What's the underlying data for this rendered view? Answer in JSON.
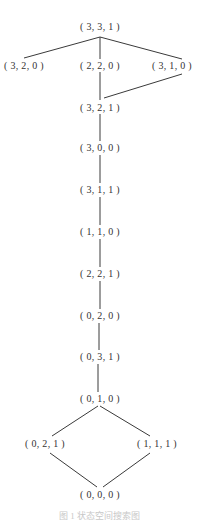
{
  "diagram": {
    "type": "state-lattice",
    "nodes": [
      {
        "id": "n331",
        "label": "( 3, 3, 1 )",
        "x": 100,
        "y": 27
      },
      {
        "id": "n320",
        "label": "( 3, 2, 0 )",
        "x": 24,
        "y": 66
      },
      {
        "id": "n220",
        "label": "( 2, 2, 0 )",
        "x": 100,
        "y": 66
      },
      {
        "id": "n310",
        "label": "( 3, 1, 0 )",
        "x": 172,
        "y": 66
      },
      {
        "id": "n321",
        "label": "( 3, 2, 1 )",
        "x": 100,
        "y": 108
      },
      {
        "id": "n300",
        "label": "( 3, 0, 0 )",
        "x": 100,
        "y": 148
      },
      {
        "id": "n311",
        "label": "( 3, 1, 1 )",
        "x": 100,
        "y": 190
      },
      {
        "id": "n110",
        "label": "( 1, 1, 0 )",
        "x": 100,
        "y": 232
      },
      {
        "id": "n221",
        "label": "( 2, 2, 1 )",
        "x": 100,
        "y": 274
      },
      {
        "id": "n020",
        "label": "( 0, 2, 0 )",
        "x": 100,
        "y": 316
      },
      {
        "id": "n031",
        "label": "( 0, 3, 1 )",
        "x": 100,
        "y": 357
      },
      {
        "id": "n010",
        "label": "( 0, 1, 0 )",
        "x": 100,
        "y": 399
      },
      {
        "id": "n021",
        "label": "( 0, 2, 1 )",
        "x": 45,
        "y": 444
      },
      {
        "id": "n111",
        "label": "( 1, 1, 1 )",
        "x": 157,
        "y": 444
      },
      {
        "id": "n000",
        "label": "( 0, 0, 0 )",
        "x": 100,
        "y": 495
      }
    ],
    "edges": [
      {
        "from": "n331",
        "to": "n320",
        "x1": 100,
        "y1": 37,
        "x2": 24,
        "y2": 58
      },
      {
        "from": "n331",
        "to": "n220",
        "x1": 100,
        "y1": 37,
        "x2": 100,
        "y2": 59
      },
      {
        "from": "n331",
        "to": "n310",
        "x1": 100,
        "y1": 37,
        "x2": 182,
        "y2": 59
      },
      {
        "from": "n220",
        "to": "n321",
        "x1": 100,
        "y1": 72,
        "x2": 100,
        "y2": 100
      },
      {
        "from": "n310",
        "to": "n321",
        "x1": 182,
        "y1": 74,
        "x2": 104,
        "y2": 98
      },
      {
        "from": "n321",
        "to": "n300",
        "x1": 100,
        "y1": 114,
        "x2": 100,
        "y2": 141
      },
      {
        "from": "n300",
        "to": "n311",
        "x1": 100,
        "y1": 155,
        "x2": 100,
        "y2": 183
      },
      {
        "from": "n311",
        "to": "n110",
        "x1": 100,
        "y1": 197,
        "x2": 100,
        "y2": 225
      },
      {
        "from": "n110",
        "to": "n221",
        "x1": 100,
        "y1": 239,
        "x2": 100,
        "y2": 267
      },
      {
        "from": "n221",
        "to": "n020",
        "x1": 100,
        "y1": 281,
        "x2": 100,
        "y2": 309
      },
      {
        "from": "n020",
        "to": "n031",
        "x1": 99,
        "y1": 323,
        "x2": 99,
        "y2": 350
      },
      {
        "from": "n031",
        "to": "n010",
        "x1": 98,
        "y1": 364,
        "x2": 98,
        "y2": 392
      },
      {
        "from": "n010",
        "to": "n021",
        "x1": 98,
        "y1": 406,
        "x2": 52,
        "y2": 436
      },
      {
        "from": "n010",
        "to": "n111",
        "x1": 100,
        "y1": 406,
        "x2": 150,
        "y2": 436
      },
      {
        "from": "n021",
        "to": "n000",
        "x1": 50,
        "y1": 453,
        "x2": 97,
        "y2": 487
      },
      {
        "from": "n111",
        "to": "n000",
        "x1": 150,
        "y1": 453,
        "x2": 103,
        "y2": 487
      }
    ],
    "caption": "图 1  状态空间搜索图"
  }
}
